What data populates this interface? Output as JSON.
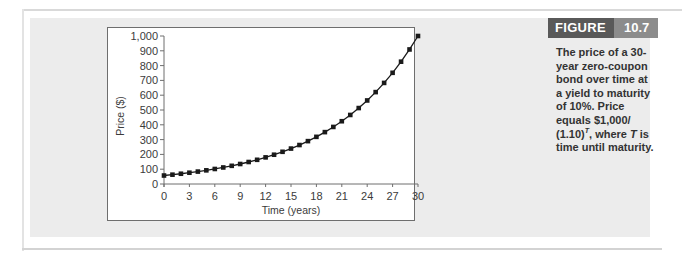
{
  "figure": {
    "label": "FIGURE",
    "number": "10.7",
    "caption_parts": {
      "line": "The price of a 30-year zero-coupon bond over time at a yield to maturity of 10%. Price equals $1,000/",
      "formula_base": "(1.10)",
      "formula_exp": "T",
      "after_exp": ", where ",
      "var": "T",
      "tail": " is time until maturity."
    }
  },
  "colors": {
    "header_dark": "#595959",
    "header_light": "#8c8c8c",
    "panel": "#ececec",
    "line": "#1a1a1a"
  },
  "chart_data": {
    "type": "line",
    "title": "",
    "xlabel": "Time (years)",
    "ylabel": "Price ($)",
    "xlim": [
      0,
      30
    ],
    "ylim": [
      0,
      1000
    ],
    "x_ticks": [
      0,
      3,
      6,
      9,
      12,
      15,
      18,
      21,
      24,
      27,
      30
    ],
    "x_tick_labels": [
      "0",
      "3",
      "6",
      "9",
      "12",
      "15",
      "18",
      "21",
      "24",
      "27",
      "30"
    ],
    "y_ticks": [
      0,
      100,
      200,
      300,
      400,
      500,
      600,
      700,
      800,
      900,
      1000
    ],
    "y_tick_labels": [
      "0",
      "100",
      "200",
      "300",
      "400",
      "500",
      "600",
      "700",
      "800",
      "900",
      "1,000"
    ],
    "grid": false,
    "legend": "none",
    "series": [
      {
        "name": "Bond price",
        "marker": "square",
        "x": [
          0,
          1,
          2,
          3,
          4,
          5,
          6,
          7,
          8,
          9,
          10,
          11,
          12,
          13,
          14,
          15,
          16,
          17,
          18,
          19,
          20,
          21,
          22,
          23,
          24,
          25,
          26,
          27,
          28,
          29,
          30
        ],
        "values": [
          57.31,
          63.04,
          69.34,
          76.28,
          83.91,
          92.3,
          101.53,
          111.68,
          122.85,
          135.13,
          148.64,
          163.51,
          179.86,
          197.84,
          217.63,
          239.39,
          263.33,
          289.66,
          318.63,
          350.49,
          385.54,
          424.1,
          466.51,
          513.16,
          564.47,
          620.92,
          683.01,
          751.31,
          826.45,
          909.09,
          1000.0
        ]
      }
    ]
  }
}
